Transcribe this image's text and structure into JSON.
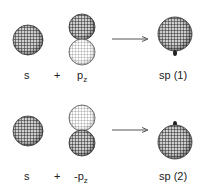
{
  "rows": [
    {
      "s_label": "s",
      "plus": "+",
      "p_prefix": "",
      "p_main": "p",
      "p_sub": "z",
      "result": "sp (1)"
    },
    {
      "s_label": "s",
      "plus": "+",
      "p_prefix": "-",
      "p_main": "p",
      "p_sub": "z",
      "result": "sp (2)"
    }
  ],
  "colors": {
    "mesh_dark": "#2a2a2a",
    "mesh_light": "#9a9a9a",
    "arrow": "#555555"
  }
}
